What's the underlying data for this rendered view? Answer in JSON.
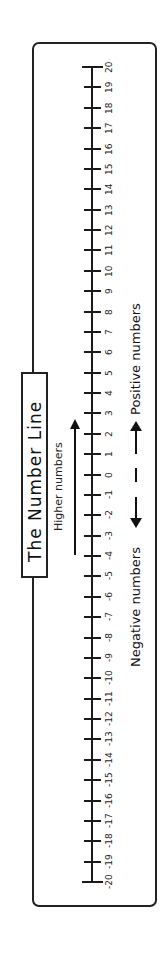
{
  "diagram": {
    "title": "The Number Line",
    "hint_label": "Higher numbers",
    "hint_arrow_icon": "arrow-up-icon",
    "legend": {
      "negative_label": "Negative numbers",
      "positive_label": "Positive numbers",
      "center_mark": "|",
      "negative_arrow_icon": "arrow-left-icon",
      "positive_arrow_icon": "arrow-right-icon"
    },
    "number_line": {
      "min": -20,
      "max": 20,
      "step": 1,
      "orientation": "vertical, rotated 90° counter-clockwise (higher numbers toward top)",
      "tick_labels": [
        "20",
        "19",
        "18",
        "17",
        "16",
        "15",
        "14",
        "13",
        "12",
        "11",
        "10",
        "9",
        "8",
        "7",
        "6",
        "5",
        "4",
        "3",
        "2",
        "1",
        "0",
        "-1",
        "-2",
        "-3",
        "-4",
        "-5",
        "-6",
        "-7",
        "-8",
        "-9",
        "-10",
        "-11",
        "-12",
        "-13",
        "-14",
        "-15",
        "-16",
        "-17",
        "-18",
        "-19",
        "-20"
      ]
    },
    "colors": {
      "ink": "#111111",
      "background": "#ffffff"
    }
  }
}
